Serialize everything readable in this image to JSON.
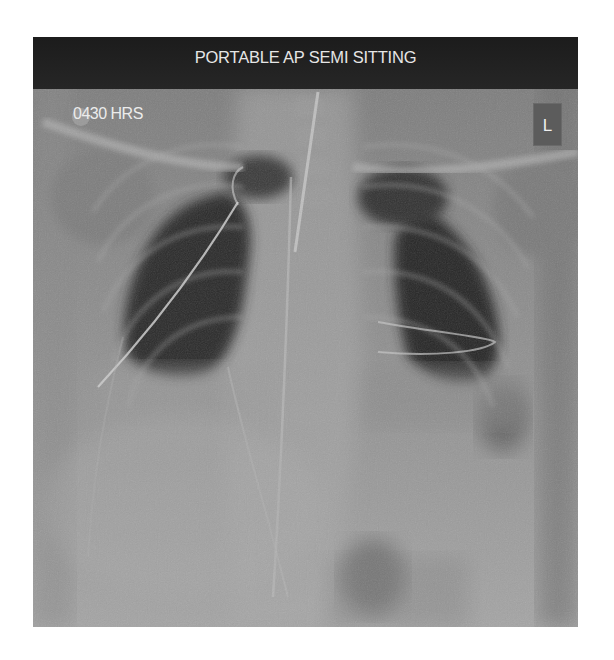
{
  "image": {
    "type": "chest radiograph",
    "projection_label": "PORTABLE AP SEMI SITTING",
    "time_label": "0430 HRS",
    "side_marker": "L"
  },
  "colors": {
    "background": "#ffffff",
    "header_band": "#1f1f1f",
    "label_text": "#e6e6e6",
    "soft_tissue": "#8e8e8e",
    "lung_field": "#2a2a2a",
    "marker_box": "#5c5c5c"
  }
}
